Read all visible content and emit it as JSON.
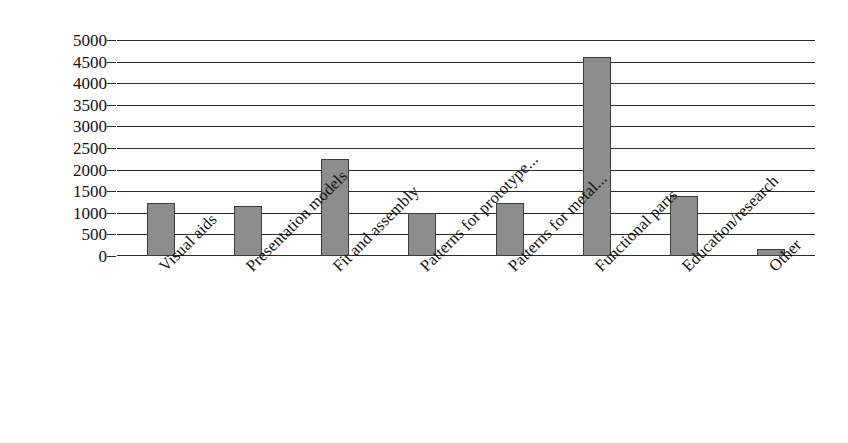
{
  "chart_data": {
    "type": "bar",
    "title": "",
    "xlabel": "",
    "ylabel": "Total number of prints",
    "ylim": [
      0,
      5000
    ],
    "ytick_labels": [
      "5000",
      "4500",
      "4000",
      "3500",
      "3000",
      "2500",
      "2000",
      "1500",
      "1000",
      "500",
      "0"
    ],
    "ytick_values": [
      5000,
      4500,
      4000,
      3500,
      3000,
      2500,
      2000,
      1500,
      1000,
      500,
      0
    ],
    "grid": true,
    "legend": "none",
    "categories": [
      "Visual aids",
      "Presentation models",
      "Fit and assembly",
      "Patterns  for prototype...",
      "Patterns for metal...",
      "Functional parts",
      "Education/research",
      "Other"
    ],
    "values": [
      1220,
      1150,
      2250,
      990,
      1220,
      4600,
      1400,
      160
    ],
    "bar_color": "#8d8d8d",
    "bar_edge_color": "#3d3d3d",
    "axis_color": "#2b2b2b",
    "background": "#ffffff"
  }
}
